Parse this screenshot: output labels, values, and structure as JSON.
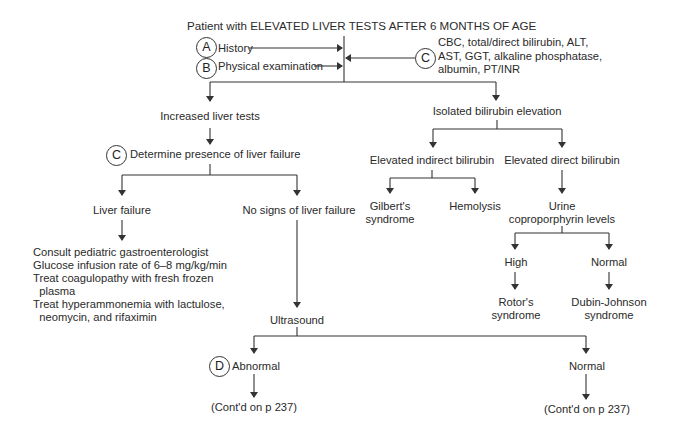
{
  "title": "Patient with ELEVATED LIVER TESTS AFTER 6 MONTHS OF AGE",
  "badges": {
    "A": "A",
    "B": "B",
    "C": "C",
    "D": "D"
  },
  "inputs": {
    "history": "History",
    "physical": "Physical examination",
    "labs": [
      "CBC, total/direct bilirubin, ALT,",
      "AST, GGT, alkaline phosphatase,",
      "albumin, PT/INR"
    ]
  },
  "left": {
    "increased": "Increased liver tests",
    "determine": "Determine presence of liver failure",
    "failure": "Liver failure",
    "no_failure": "No signs of liver failure",
    "management": [
      "Consult pediatric gastroenterologist",
      "Glucose infusion rate of 6–8 mg/kg/min",
      "Treat coagulopathy with fresh frozen",
      "  plasma",
      "Treat hyperammonemia with lactulose,",
      "  neomycin, and rifaximin"
    ],
    "ultrasound": "Ultrasound",
    "abnormal": "Abnormal",
    "normal": "Normal",
    "contd_abnormal": "(Cont'd on p 237)",
    "contd_normal": "(Cont'd on p 237)"
  },
  "right": {
    "isolated": "Isolated bilirubin elevation",
    "indirect": "Elevated indirect bilirubin",
    "direct": "Elevated direct bilirubin",
    "gilbert": [
      "Gilbert's",
      "syndrome"
    ],
    "hemolysis": "Hemolysis",
    "urine": [
      "Urine",
      "coproporphyrin levels"
    ],
    "high": "High",
    "normal": "Normal",
    "rotor": [
      "Rotor's",
      "syndrome"
    ],
    "dubin": [
      "Dubin-Johnson",
      "syndrome"
    ]
  }
}
